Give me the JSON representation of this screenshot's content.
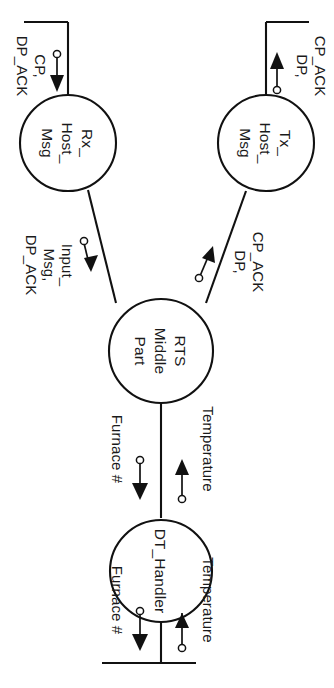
{
  "diagram": {
    "orientation": "rotated-90-clockwise",
    "background_color": "#ffffff",
    "stroke_color": "#111111",
    "nodes": [
      {
        "id": "dt-handler",
        "lines": [
          "DT_Handler"
        ],
        "label": "DT_Handler"
      },
      {
        "id": "rts-middle-part",
        "lines": [
          "RTS",
          "Middle",
          "Part"
        ],
        "label": "RTS Middle Part"
      },
      {
        "id": "tx-host-msg",
        "lines": [
          "Tx_",
          "Host_",
          "Msg"
        ],
        "label": "Tx_Host_Msg"
      },
      {
        "id": "rx-host-msg",
        "lines": [
          "Rx_",
          "Host_",
          "Msg"
        ],
        "label": "Rx_Host_Msg"
      }
    ],
    "flows": {
      "external_top_in": {
        "label": "Temperature",
        "direction": "in"
      },
      "external_top_out": {
        "label": "Furnace #",
        "direction": "out"
      },
      "dt_to_rts_in": {
        "label": "Temperature",
        "direction": "in"
      },
      "dt_to_rts_out": {
        "label": "Furnace #",
        "direction": "out"
      },
      "rts_to_tx": {
        "lines": [
          "DP,",
          "CP_ACK"
        ],
        "label": "DP, CP_ACK",
        "direction": "out"
      },
      "rx_to_rts": {
        "lines": [
          "Input_",
          "Msg,",
          "DP_ACK"
        ],
        "label": "Input_Msg, DP_ACK",
        "direction": "in"
      },
      "tx_external": {
        "lines": [
          "DP,",
          "CP_ACK"
        ],
        "label": "DP, CP_ACK",
        "direction": "out"
      },
      "rx_external": {
        "lines": [
          "CP,",
          "DP_ACK"
        ],
        "label": "CP, DP_ACK",
        "direction": "in"
      }
    }
  }
}
